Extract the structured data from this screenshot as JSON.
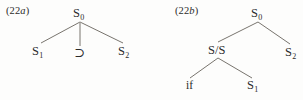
{
  "figure": {
    "background_color": "#fdfdfc",
    "line_color": "#555049",
    "text_color": "#2b2b2b"
  },
  "trees": [
    {
      "id": "22a",
      "label_prefix": "(22",
      "label_letter": "a",
      "label_suffix": ")",
      "nodes": [
        {
          "name": "root",
          "text": "S",
          "sub": "0"
        },
        {
          "name": "left-daughter",
          "text": "S",
          "sub": "1"
        },
        {
          "name": "middle-daughter",
          "text": "⊃",
          "sub": ""
        },
        {
          "name": "right-daughter",
          "text": "S",
          "sub": "2"
        }
      ]
    },
    {
      "id": "22b",
      "label_prefix": "(22",
      "label_letter": "b",
      "label_suffix": ")",
      "nodes": [
        {
          "name": "root",
          "text": "S",
          "sub": "0"
        },
        {
          "name": "left-daughter",
          "text": "S/S",
          "sub": ""
        },
        {
          "name": "right-daughter",
          "text": "S",
          "sub": "2"
        },
        {
          "name": "terminal-if",
          "text": "if",
          "sub": ""
        },
        {
          "name": "terminal-s1",
          "text": "S",
          "sub": "1"
        }
      ]
    }
  ]
}
